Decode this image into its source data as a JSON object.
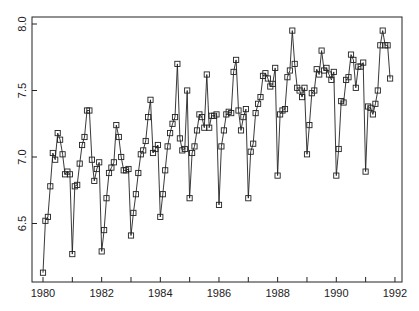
{
  "chart_data": {
    "type": "line",
    "title": "",
    "xlabel": "",
    "ylabel": "",
    "marker": "square",
    "x_start": 1980.0,
    "x_step": 0.08333,
    "xlim": [
      1979.6,
      1992.25
    ],
    "ylim": [
      6.05,
      8.05
    ],
    "x_ticks": [
      1980,
      1981,
      1982,
      1983,
      1984,
      1985,
      1986,
      1987,
      1988,
      1989,
      1990,
      1991,
      1992
    ],
    "x_tick_labels": [
      "1980",
      "",
      "1982",
      "",
      "1984",
      "",
      "1986",
      "",
      "1988",
      "",
      "1990",
      "",
      "1992"
    ],
    "y_ticks": [
      6.5,
      7.0,
      7.5,
      8.0
    ],
    "y_tick_labels": [
      "6.5",
      "7.0",
      "7.5",
      "8.0"
    ],
    "grid": false,
    "legend": null,
    "series": [
      {
        "name": "monthly series",
        "values": [
          6.13,
          6.52,
          6.55,
          6.78,
          7.03,
          6.98,
          7.18,
          7.13,
          7.02,
          6.87,
          6.89,
          6.87,
          6.27,
          6.78,
          6.79,
          6.95,
          7.09,
          7.15,
          7.35,
          7.35,
          6.98,
          6.82,
          6.91,
          6.96,
          6.29,
          6.45,
          6.69,
          6.88,
          6.92,
          6.96,
          7.24,
          7.15,
          7.0,
          6.9,
          6.9,
          6.91,
          6.41,
          6.58,
          6.72,
          6.88,
          7.02,
          7.05,
          7.12,
          7.3,
          7.43,
          7.03,
          7.06,
          7.09,
          6.55,
          6.72,
          6.9,
          7.08,
          7.18,
          7.25,
          7.3,
          7.7,
          7.14,
          7.05,
          7.06,
          7.5,
          6.69,
          7.03,
          7.08,
          7.2,
          7.32,
          7.3,
          7.22,
          7.62,
          7.22,
          7.31,
          7.31,
          7.32,
          6.64,
          7.08,
          7.2,
          7.32,
          7.34,
          7.33,
          7.64,
          7.73,
          7.35,
          7.2,
          7.3,
          7.36,
          6.69,
          7.04,
          7.1,
          7.33,
          7.4,
          7.45,
          7.61,
          7.63,
          7.59,
          7.53,
          7.55,
          7.67,
          6.86,
          7.32,
          7.35,
          7.36,
          7.6,
          7.65,
          7.95,
          7.7,
          7.52,
          7.5,
          7.45,
          7.52,
          7.02,
          7.24,
          7.48,
          7.5,
          7.66,
          7.62,
          7.8,
          7.65,
          7.67,
          7.62,
          7.58,
          7.64,
          6.86,
          7.06,
          7.42,
          7.41,
          7.58,
          7.6,
          7.77,
          7.73,
          7.52,
          7.68,
          7.68,
          7.71,
          6.89,
          7.38,
          7.37,
          7.32,
          7.4,
          7.5,
          7.84,
          7.95,
          7.84,
          7.84,
          7.59
        ]
      }
    ]
  },
  "layout": {
    "plot_left": 32,
    "plot_right": 402,
    "plot_top": 17,
    "plot_bottom": 282,
    "x_px_at_1980": 43,
    "x_px_per_year": 29.33,
    "y_px_at_8": 24,
    "y_px_per_unit": 133
  }
}
